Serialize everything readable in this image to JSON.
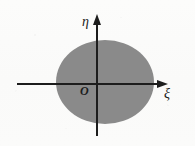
{
  "figure": {
    "background_color": "#fbfbfa",
    "width": 195,
    "height": 146
  },
  "axes": {
    "horizontal": {
      "name": "xi-axis",
      "label": "ξ",
      "color": "#1d1d1d",
      "start_x": 17,
      "end_x": 168,
      "y": 84,
      "arrow": "right"
    },
    "vertical": {
      "name": "eta-axis",
      "label": "η",
      "color": "#1d1d1d",
      "x": 97,
      "start_y": 136,
      "end_y": 15,
      "arrow": "up"
    },
    "origin": {
      "label": "O",
      "x": 97,
      "y": 84
    }
  },
  "region": {
    "name": "shaded-ellipse",
    "shape": "ellipse",
    "fill_color": "#8a8a8a",
    "center_x": 105,
    "center_y": 82,
    "semi_axis_x": 49,
    "semi_axis_y": 42
  },
  "chart_data": {
    "type": "area",
    "title": "",
    "xlabel": "ξ",
    "ylabel": "η",
    "grid": false,
    "legend": "none",
    "annotations": [
      "O",
      "ξ",
      "η"
    ],
    "shapes": [
      {
        "kind": "ellipse",
        "label": "shaded region",
        "center": [
          8,
          -2
        ],
        "semi_axes": [
          49,
          42
        ],
        "fill": "#8a8a8a"
      }
    ]
  }
}
